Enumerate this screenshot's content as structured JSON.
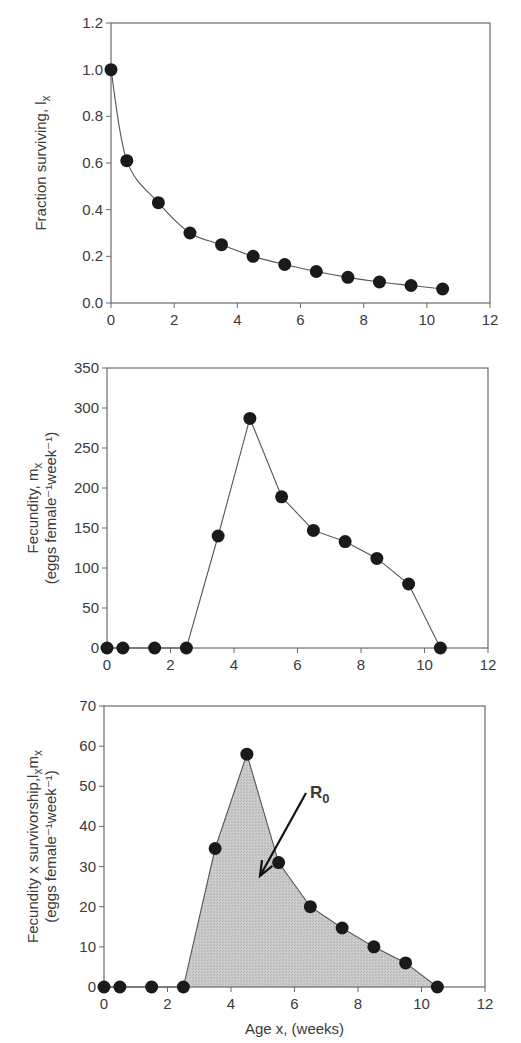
{
  "colors": {
    "axis": "#6a6a6a",
    "line": "#555555",
    "marker": "#1a1a1a",
    "fill": "#c6c6c6",
    "text": "#3a3a3a",
    "arrow": "#111111"
  },
  "chart_data": [
    {
      "id": "survivorship",
      "type": "line",
      "title": "",
      "xlabel": "",
      "ylabel": "Fraction surviving, l",
      "ylabel_sub": "x",
      "ylabel2": "",
      "x": [
        0,
        0.5,
        1.5,
        2.5,
        3.5,
        4.5,
        5.5,
        6.5,
        7.5,
        8.5,
        9.5,
        10.5
      ],
      "values": [
        1.0,
        0.61,
        0.43,
        0.3,
        0.25,
        0.2,
        0.165,
        0.135,
        0.11,
        0.09,
        0.075,
        0.06
      ],
      "xlim": [
        0,
        12
      ],
      "ylim": [
        0,
        1.2
      ],
      "xticks": [
        "0",
        "2",
        "4",
        "6",
        "8",
        "10",
        "12"
      ],
      "yticks": [
        "0.0",
        "0.2",
        "0.4",
        "0.6",
        "0.8",
        "1.0",
        "1.2"
      ],
      "smooth": true,
      "filled": false,
      "grid": false,
      "box": {
        "left": 111,
        "right": 490,
        "top": 23,
        "bottom": 303
      }
    },
    {
      "id": "fecundity",
      "type": "line",
      "title": "",
      "xlabel": "",
      "ylabel": "Fecundity, m",
      "ylabel_sub": "x",
      "ylabel2": "(eggs female⁻¹week⁻¹)",
      "x": [
        0,
        0.5,
        1.5,
        2.5,
        3.5,
        4.5,
        5.5,
        6.5,
        7.5,
        8.5,
        9.5,
        10.5
      ],
      "values": [
        0,
        0,
        0,
        0,
        140,
        287,
        189,
        147,
        133,
        112,
        80,
        0
      ],
      "xlim": [
        0,
        12
      ],
      "ylim": [
        0,
        350
      ],
      "xticks": [
        "0",
        "2",
        "4",
        "6",
        "8",
        "10",
        "12"
      ],
      "yticks": [
        "0",
        "50",
        "100",
        "150",
        "200",
        "250",
        "300",
        "350"
      ],
      "smooth": false,
      "filled": false,
      "grid": false,
      "box": {
        "left": 107,
        "right": 488,
        "top": 368,
        "bottom": 648
      }
    },
    {
      "id": "net-reproduction",
      "type": "area",
      "title": "",
      "xlabel": "Age x, (weeks)",
      "ylabel": "Fecundity x survivorship,l",
      "ylabel_sub": "x",
      "ylabel_tail": "m",
      "ylabel_tail_sub": "x",
      "ylabel2": "(eggs female⁻¹week⁻¹)",
      "x": [
        0,
        0.5,
        1.5,
        2.5,
        3.5,
        4.5,
        5.5,
        6.5,
        7.5,
        8.5,
        9.5,
        10.5
      ],
      "values": [
        0,
        0,
        0,
        0,
        34.5,
        58,
        31,
        20,
        14.7,
        10,
        6,
        0
      ],
      "xlim": [
        0,
        12
      ],
      "ylim": [
        0,
        70
      ],
      "xticks": [
        "0",
        "2",
        "4",
        "6",
        "8",
        "10",
        "12"
      ],
      "yticks": [
        "0",
        "10",
        "20",
        "30",
        "40",
        "50",
        "60",
        "70"
      ],
      "smooth": false,
      "filled": true,
      "grid": false,
      "annotation": {
        "text": "R",
        "sub": "0",
        "label_pos": [
          310,
          798
        ],
        "arrow_from": [
          306,
          793
        ],
        "arrow_to": [
          260,
          876
        ]
      },
      "box": {
        "left": 104,
        "right": 485,
        "top": 706,
        "bottom": 987
      }
    }
  ]
}
